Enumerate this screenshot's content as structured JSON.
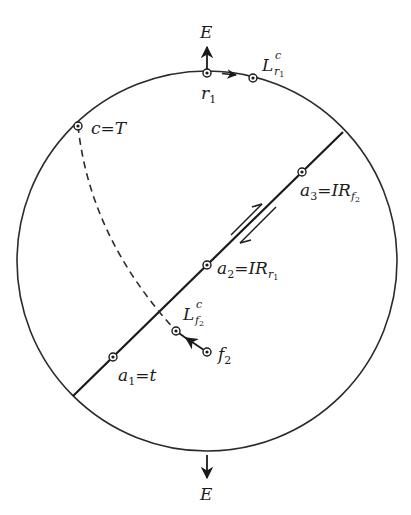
{
  "diagram": {
    "circle": {
      "cx": 207,
      "cy": 261,
      "r": 190,
      "stroke": "#2b2b2b"
    },
    "line": {
      "x1": 73,
      "y1": 396,
      "x2": 343,
      "y2": 132,
      "stroke": "#1a1a1a"
    },
    "dashed_curve": {
      "from": "c=T",
      "to": "L^c_f2",
      "stroke": "#2b2b2b"
    },
    "labels": {
      "e_top": "E",
      "e_bottom": "E",
      "r1_base": "r",
      "r1_sub": "1",
      "lr1_base": "L",
      "lr1_sup": "c",
      "lr1_sub": "r",
      "lr1_subsub": "1",
      "c_eq_t": "c=T",
      "a3_base": "a",
      "a3_sub": "3",
      "a3_eq": "=IR",
      "a3_rsub": "f",
      "a3_rsubsub": "2",
      "a2_base": "a",
      "a2_sub": "2",
      "a2_eq": "=IR",
      "a2_rsub": "r",
      "a2_rsubsub": "1",
      "lf2_base": "L",
      "lf2_sup": "c",
      "lf2_sub": "f",
      "lf2_subsub": "2",
      "f2_base": "f",
      "f2_sub": "2",
      "a1_base": "a",
      "a1_sub": "1",
      "a1_eq": "=t"
    },
    "points": [
      {
        "name": "r1",
        "x": 207,
        "y": 73
      },
      {
        "name": "L^c_r1",
        "x": 253,
        "y": 78
      },
      {
        "name": "c=T",
        "x": 78,
        "y": 126
      },
      {
        "name": "a3",
        "x": 302,
        "y": 172
      },
      {
        "name": "a2",
        "x": 207,
        "y": 265
      },
      {
        "name": "L^c_f2",
        "x": 176,
        "y": 331
      },
      {
        "name": "f2",
        "x": 207,
        "y": 352
      },
      {
        "name": "a1",
        "x": 113,
        "y": 357
      }
    ]
  }
}
